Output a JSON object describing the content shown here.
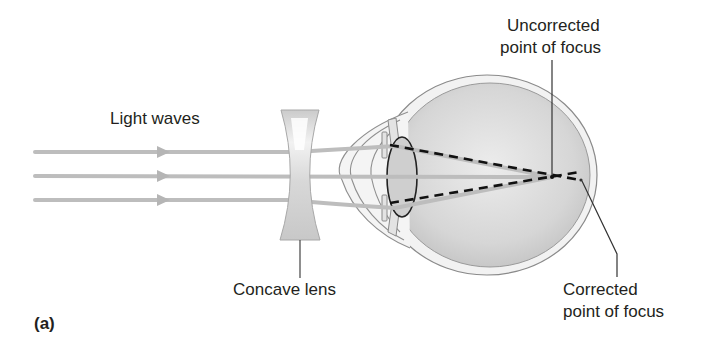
{
  "figure": {
    "panel_label": "(a)",
    "labels": {
      "light_waves": "Light waves",
      "concave_lens": "Concave lens",
      "uncorrected_line1": "Uncorrected",
      "uncorrected_line2": "point of focus",
      "corrected_line1": "Corrected",
      "corrected_line2": "point of focus"
    },
    "colors": {
      "ray": "#bdbdbd",
      "lens_fill": "#cfcfcf",
      "eye_outline": "#8a8a8a",
      "eyeball_fill": "#d9d9d9",
      "dashed_ray": "#111111",
      "leader_line": "#333333",
      "text": "#231f20"
    }
  }
}
